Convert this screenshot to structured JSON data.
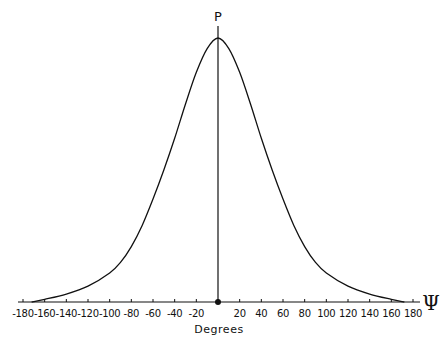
{
  "chart_data": {
    "type": "line",
    "title": "",
    "xlabel": "Degrees",
    "ylabel": "",
    "axis_symbol": "Ψ",
    "peak_label": "P",
    "xlim": [
      -180,
      180
    ],
    "x_ticks": [
      -180,
      -160,
      -140,
      -120,
      -100,
      -80,
      -60,
      -40,
      -20,
      0,
      20,
      40,
      60,
      80,
      100,
      120,
      140,
      160,
      180
    ],
    "x_tick_labels": [
      "-180",
      "-160",
      "-140",
      "-120",
      "-100",
      "-80",
      "-60",
      "-40",
      "-20",
      "",
      "20",
      "40",
      "60",
      "80",
      "100",
      "120",
      "140",
      "160",
      "180"
    ],
    "grid": false,
    "legend": null,
    "series": [
      {
        "name": "distribution",
        "x": [
          -172,
          -160,
          -140,
          -120,
          -100,
          -90,
          -80,
          -70,
          -60,
          -50,
          -40,
          -30,
          -20,
          -10,
          0,
          10,
          20,
          30,
          40,
          50,
          60,
          70,
          80,
          90,
          100,
          120,
          140,
          160,
          172
        ],
        "values": [
          0.0,
          0.01,
          0.03,
          0.06,
          0.11,
          0.15,
          0.21,
          0.29,
          0.39,
          0.5,
          0.62,
          0.75,
          0.87,
          0.96,
          1.0,
          0.96,
          0.87,
          0.75,
          0.62,
          0.5,
          0.39,
          0.29,
          0.21,
          0.15,
          0.11,
          0.06,
          0.03,
          0.01,
          0.0
        ]
      }
    ],
    "markers": [
      {
        "label": "P",
        "x": 0,
        "type": "vertical-line"
      }
    ]
  }
}
